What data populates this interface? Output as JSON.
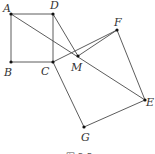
{
  "diagram": {
    "points": {
      "A": {
        "x": 11,
        "y": 14,
        "label": "A",
        "lx": 3,
        "ly": 12
      },
      "B": {
        "x": 11,
        "y": 62,
        "label": "B",
        "lx": 4,
        "ly": 76
      },
      "C": {
        "x": 53,
        "y": 62,
        "label": "C",
        "lx": 41,
        "ly": 75
      },
      "D": {
        "x": 53,
        "y": 14,
        "label": "D",
        "lx": 50,
        "ly": 9
      },
      "M": {
        "x": 78,
        "y": 56,
        "label": "M",
        "lx": 71,
        "ly": 71
      },
      "F": {
        "x": 117,
        "y": 30,
        "label": "F",
        "lx": 114,
        "ly": 26
      },
      "E": {
        "x": 145,
        "y": 100,
        "label": "E",
        "lx": 146,
        "ly": 106
      },
      "G": {
        "x": 84,
        "y": 127,
        "label": "G",
        "lx": 81,
        "ly": 141
      }
    },
    "segments": [
      [
        "A",
        "D"
      ],
      [
        "A",
        "B"
      ],
      [
        "B",
        "C"
      ],
      [
        "C",
        "D"
      ],
      [
        "A",
        "E"
      ],
      [
        "D",
        "M"
      ],
      [
        "C",
        "F"
      ],
      [
        "F",
        "E"
      ],
      [
        "E",
        "G"
      ],
      [
        "G",
        "C"
      ],
      [
        "M",
        "F"
      ]
    ],
    "caption": "图 3-5",
    "stroke_color": "#4a4a4a",
    "point_color": "#111111"
  }
}
